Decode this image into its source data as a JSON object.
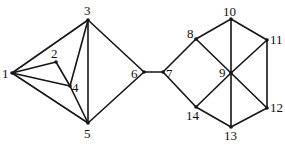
{
  "diagram": {
    "type": "undirected-graph",
    "colors": {
      "edge": "#151515",
      "label": "#111111",
      "background": "#ffffff"
    },
    "nodes": [
      {
        "id": "1",
        "label": "1",
        "x": 12,
        "y": 73,
        "lx": 2,
        "ly": 78
      },
      {
        "id": "2",
        "label": "2",
        "x": 56,
        "y": 62,
        "lx": 51,
        "ly": 58
      },
      {
        "id": "3",
        "label": "3",
        "x": 88,
        "y": 20,
        "lx": 84,
        "ly": 15
      },
      {
        "id": "4",
        "label": "4",
        "x": 70,
        "y": 86,
        "lx": 72,
        "ly": 92
      },
      {
        "id": "5",
        "label": "5",
        "x": 88,
        "y": 123,
        "lx": 84,
        "ly": 138
      },
      {
        "id": "6",
        "label": "6",
        "x": 144,
        "y": 72,
        "lx": 131,
        "ly": 78
      },
      {
        "id": "7",
        "label": "7",
        "x": 163,
        "y": 72,
        "lx": 166,
        "ly": 78
      },
      {
        "id": "8",
        "label": "8",
        "x": 196,
        "y": 39,
        "lx": 187,
        "ly": 38
      },
      {
        "id": "9",
        "label": "9",
        "x": 231,
        "y": 73,
        "lx": 219,
        "ly": 77
      },
      {
        "id": "10",
        "label": "10",
        "x": 231,
        "y": 19,
        "lx": 223,
        "ly": 16
      },
      {
        "id": "11",
        "label": "11",
        "x": 267,
        "y": 40,
        "lx": 270,
        "ly": 44
      },
      {
        "id": "12",
        "label": "12",
        "x": 267,
        "y": 108,
        "lx": 270,
        "ly": 112
      },
      {
        "id": "13",
        "label": "13",
        "x": 231,
        "y": 127,
        "lx": 224,
        "ly": 140
      },
      {
        "id": "14",
        "label": "14",
        "x": 196,
        "y": 107,
        "lx": 186,
        "ly": 120
      }
    ],
    "edges": [
      [
        "1",
        "3"
      ],
      [
        "1",
        "2"
      ],
      [
        "1",
        "4"
      ],
      [
        "1",
        "5"
      ],
      [
        "2",
        "4"
      ],
      [
        "3",
        "4"
      ],
      [
        "3",
        "5"
      ],
      [
        "3",
        "6"
      ],
      [
        "4",
        "5"
      ],
      [
        "5",
        "6"
      ],
      [
        "6",
        "7"
      ],
      [
        "7",
        "8"
      ],
      [
        "7",
        "14"
      ],
      [
        "8",
        "10"
      ],
      [
        "8",
        "9"
      ],
      [
        "10",
        "11"
      ],
      [
        "10",
        "9"
      ],
      [
        "11",
        "9"
      ],
      [
        "11",
        "12"
      ],
      [
        "9",
        "12"
      ],
      [
        "9",
        "13"
      ],
      [
        "9",
        "14"
      ],
      [
        "12",
        "13"
      ],
      [
        "13",
        "14"
      ]
    ]
  }
}
